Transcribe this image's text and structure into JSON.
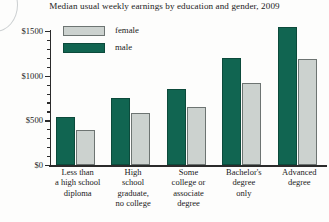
{
  "chart_data": {
    "type": "bar",
    "title": "Median usual weekly earnings by education and gender, 2009",
    "xlabel": "",
    "ylabel": "",
    "ylim": [
      0,
      1500
    ],
    "yticks": [
      0,
      500,
      1000,
      1500
    ],
    "ytick_labels": [
      "$0",
      "$500",
      "$1000",
      "$1500"
    ],
    "minor_tick_step": 100,
    "grid": false,
    "legend_position": "upper-left-inside",
    "categories": [
      "Less than a high school diploma",
      "High school graduate, no college",
      "Some college or associate degree",
      "Bachelor's degree only",
      "Advanced degree"
    ],
    "series": [
      {
        "name": "male",
        "color": "#116551",
        "values": [
          540,
          750,
          850,
          1200,
          1540
        ]
      },
      {
        "name": "female",
        "color": "#ccd2cf",
        "values": [
          390,
          580,
          650,
          920,
          1190
        ]
      }
    ]
  },
  "title": {
    "text": "Median usual weekly earnings by education and gender, 2009"
  },
  "legend": {
    "items": [
      {
        "label": "female",
        "swatch": "female"
      },
      {
        "label": "male",
        "swatch": "male"
      }
    ]
  },
  "yaxis": {
    "labels": [
      "$1500",
      "$1000",
      "$500",
      "$0"
    ]
  },
  "xaxis": {
    "categories": [
      {
        "lines": [
          "Less than",
          "a high school",
          "diploma"
        ]
      },
      {
        "lines": [
          "High",
          "school",
          "graduate,",
          "no college"
        ]
      },
      {
        "lines": [
          "Some",
          "college or",
          "associate",
          "degree"
        ]
      },
      {
        "lines": [
          "Bachelor's",
          "degree",
          "only"
        ]
      },
      {
        "lines": [
          "Advanced",
          "degree"
        ]
      }
    ]
  }
}
